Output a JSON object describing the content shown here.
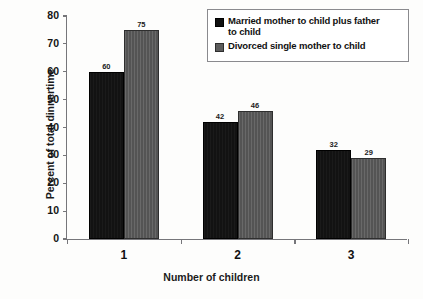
{
  "chart_data": {
    "type": "bar",
    "title": "",
    "categories": [
      "1",
      "2",
      "3"
    ],
    "series": [
      {
        "name": "Married mother to child plus father to child",
        "values": [
          60,
          42,
          32
        ],
        "color": "#121212"
      },
      {
        "name": "Divorced single mother to child",
        "values": [
          75,
          46,
          29
        ],
        "color": "#585858"
      }
    ],
    "xlabel": "Number of children",
    "ylabel": "Percent of total dinnertime",
    "ylim": [
      0,
      80
    ],
    "ytick_step": 10,
    "yticks": [
      "0",
      "10",
      "20",
      "30",
      "40",
      "50",
      "60",
      "70",
      "80"
    ],
    "grid": false,
    "legend_position": "top-right",
    "data_labels": true
  },
  "legend": {
    "entries": [
      {
        "label_line1": "Married mother to child plus father",
        "label_line2": "to child"
      },
      {
        "label_line1": "Divorced single mother to child",
        "label_line2": ""
      }
    ]
  }
}
